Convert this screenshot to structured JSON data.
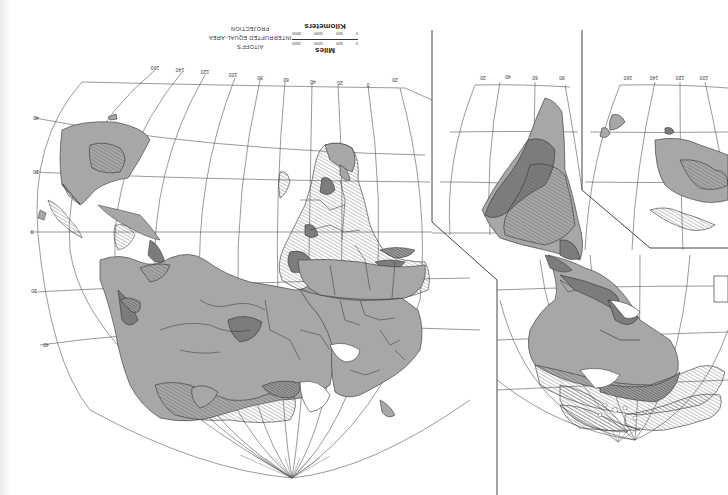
{
  "map": {
    "title_lines": [
      "AITOFF'S",
      "INTERRUPTED EQUAL-AREA",
      "PROJECTION"
    ],
    "orientation": "upside-down (south at top)",
    "scale": {
      "miles_label": "Miles",
      "miles_ticks": [
        "0",
        "500",
        "1000",
        "1500"
      ],
      "km_label": "Kilometers",
      "km_ticks": [
        "0",
        "500",
        "1000",
        "2000"
      ]
    },
    "longitude_labels_left_lobe": [
      "160",
      "140",
      "120",
      "100",
      "80",
      "60",
      "40",
      "20",
      "0",
      "20"
    ],
    "longitude_labels_mid_lobe": [
      "20",
      "40",
      "60",
      "80"
    ],
    "longitude_labels_right_lobe": [
      "160",
      "140",
      "120",
      "100"
    ],
    "latitude_labels": [
      "40",
      "20",
      "0",
      "20",
      "40"
    ],
    "fill_colors": {
      "light_zone": "#a7a7a7",
      "dark_zone": "#7c7c7c",
      "hatched_zone": "#ffffff",
      "outline": "#333333",
      "graticule": "#555555"
    }
  }
}
